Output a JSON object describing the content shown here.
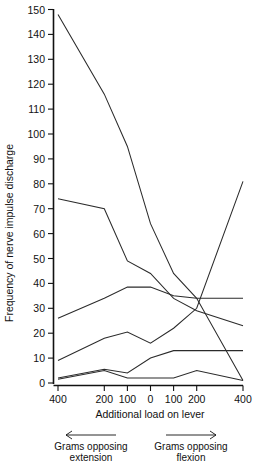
{
  "chart_data": {
    "type": "line",
    "title": "",
    "xlabel": "Additional load on lever",
    "ylabel": "Frequency of nerve impulse discharge",
    "ylim": [
      0,
      150
    ],
    "ytick_labels": [
      "0",
      "10",
      "20",
      "30",
      "40",
      "50",
      "60",
      "70",
      "80",
      "90",
      "100",
      "110",
      "120",
      "130",
      "140",
      "150"
    ],
    "ytick_values": [
      0,
      10,
      20,
      30,
      40,
      50,
      60,
      70,
      80,
      90,
      100,
      110,
      120,
      130,
      140,
      150
    ],
    "xtick_labels": [
      "400",
      "200",
      "100",
      "0",
      "100",
      "200",
      "400"
    ],
    "x": [
      -400,
      -200,
      -100,
      0,
      100,
      200,
      400
    ],
    "grid": false,
    "legend": null,
    "annotations": [
      {
        "name": "left-arrow-note",
        "line1": "Grams opposing",
        "line2": "extension",
        "arrow": "left"
      },
      {
        "name": "right-arrow-note",
        "line1": "Grams opposing",
        "line2": "flexion",
        "arrow": "right"
      }
    ],
    "series": [
      {
        "name": "unit-1",
        "values": [
          148,
          116,
          95,
          64,
          44,
          34,
          1
        ]
      },
      {
        "name": "unit-2",
        "values": [
          74,
          70,
          49,
          44,
          34,
          29,
          23
        ]
      },
      {
        "name": "unit-3",
        "values": [
          26,
          34,
          38.5,
          38.5,
          35,
          34,
          34
        ]
      },
      {
        "name": "unit-4",
        "values": [
          9,
          18,
          20.5,
          16,
          22,
          30,
          81
        ]
      },
      {
        "name": "unit-5",
        "values": [
          2,
          5.5,
          4,
          10,
          13,
          13,
          13
        ]
      },
      {
        "name": "unit-6",
        "values": [
          1.5,
          5,
          2,
          2,
          2,
          5,
          1
        ]
      }
    ]
  },
  "axes": {
    "y_axis_title": "Frequency of nerve impulse discharge",
    "x_axis_title": "Additional load on lever"
  }
}
